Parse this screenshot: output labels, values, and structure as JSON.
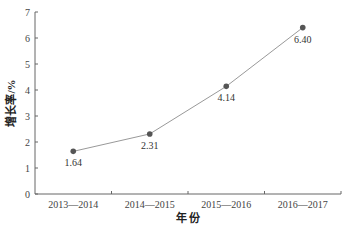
{
  "chart_data": {
    "type": "line",
    "title": "",
    "xlabel": "年 份",
    "ylabel": "增长率/%",
    "categories": [
      "2013—2014",
      "2014—2015",
      "2015—2016",
      "2016—2017"
    ],
    "series": [
      {
        "name": "增长率",
        "values": [
          1.64,
          2.31,
          4.14,
          6.4
        ],
        "labels": [
          "1.64",
          "2.31",
          "4.14",
          "6.40"
        ]
      }
    ],
    "ylim": [
      0,
      7
    ],
    "yticks": [
      "0",
      "1",
      "2",
      "3",
      "4",
      "5",
      "6",
      "7"
    ],
    "grid": false,
    "legend": null,
    "colors": {
      "line": "#999999",
      "marker": "#555555",
      "axis": "#666666"
    }
  }
}
